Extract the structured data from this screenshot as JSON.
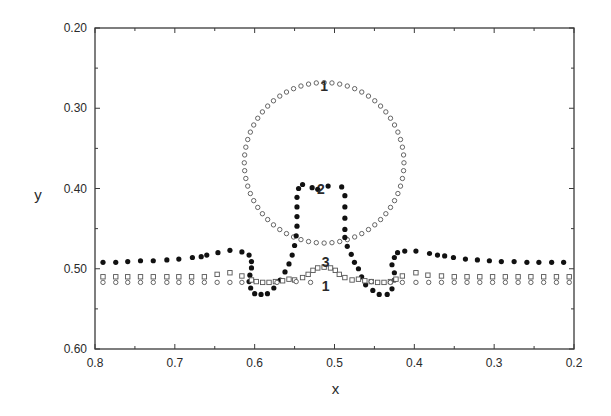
{
  "chart_data": {
    "type": "scatter",
    "title": "",
    "xlabel": "x",
    "ylabel": "y",
    "xlim": [
      0.8,
      0.2
    ],
    "ylim": [
      0.6,
      0.2
    ],
    "x_reversed": true,
    "y_reversed": true,
    "grid": false,
    "xticks": [
      {
        "value": 0.8,
        "label": "0.8"
      },
      {
        "value": 0.7,
        "label": "0.7"
      },
      {
        "value": 0.6,
        "label": "0.6"
      },
      {
        "value": 0.5,
        "label": "0.5"
      },
      {
        "value": 0.4,
        "label": "0.4"
      },
      {
        "value": 0.3,
        "label": "0.3"
      },
      {
        "value": 0.2,
        "label": "0.2"
      }
    ],
    "xminor": [
      0.75,
      0.65,
      0.55,
      0.45,
      0.35,
      0.25
    ],
    "yticks": [
      {
        "value": 0.2,
        "label": "0.20"
      },
      {
        "value": 0.3,
        "label": "0.30"
      },
      {
        "value": 0.4,
        "label": "0.40"
      },
      {
        "value": 0.5,
        "label": "0.50"
      },
      {
        "value": 0.6,
        "label": "0.60"
      }
    ],
    "yminor": [
      0.25,
      0.35,
      0.45,
      0.55
    ],
    "annotations": [
      {
        "text": "1",
        "x": 0.513,
        "y": 0.272
      },
      {
        "text": "2",
        "x": 0.517,
        "y": 0.4
      },
      {
        "text": "3",
        "x": 0.511,
        "y": 0.491
      },
      {
        "text": "1",
        "x": 0.511,
        "y": 0.522
      }
    ],
    "series": [
      {
        "name": "curve-1-circle",
        "marker": "open-circle",
        "description": "Initial circular interface (center 0.513,0.368, radius 0.1) plus flat interface at y=0.517",
        "circle": {
          "cx": 0.513,
          "cy": 0.368,
          "r": 0.1,
          "n_points": 64
        },
        "flat_y": 0.517,
        "flat_x": [
          0.79,
          0.743,
          0.695,
          0.647,
          0.6,
          0.572,
          0.548,
          0.454,
          0.43,
          0.398,
          0.35,
          0.302,
          0.254,
          0.206,
          0.774,
          0.727,
          0.679,
          0.631,
          0.616,
          0.415,
          0.382,
          0.366,
          0.334,
          0.318,
          0.286,
          0.27,
          0.238,
          0.222,
          0.759,
          0.711,
          0.663
        ]
      },
      {
        "name": "curve-2-filled",
        "marker": "filled-circle",
        "points": [
          [
            0.79,
            0.492
          ],
          [
            0.774,
            0.492
          ],
          [
            0.759,
            0.491
          ],
          [
            0.743,
            0.49
          ],
          [
            0.727,
            0.49
          ],
          [
            0.71,
            0.489
          ],
          [
            0.695,
            0.488
          ],
          [
            0.678,
            0.486
          ],
          [
            0.667,
            0.485
          ],
          [
            0.66,
            0.483
          ],
          [
            0.646,
            0.48
          ],
          [
            0.631,
            0.477
          ],
          [
            0.616,
            0.479
          ],
          [
            0.607,
            0.483
          ],
          [
            0.604,
            0.491
          ],
          [
            0.604,
            0.499
          ],
          [
            0.606,
            0.508
          ],
          [
            0.607,
            0.516
          ],
          [
            0.605,
            0.524
          ],
          [
            0.6,
            0.531
          ],
          [
            0.592,
            0.532
          ],
          [
            0.584,
            0.531
          ],
          [
            0.576,
            0.524
          ],
          [
            0.568,
            0.514
          ],
          [
            0.562,
            0.504
          ],
          [
            0.557,
            0.494
          ],
          [
            0.553,
            0.483
          ],
          [
            0.55,
            0.471
          ],
          [
            0.548,
            0.459
          ],
          [
            0.547,
            0.447
          ],
          [
            0.547,
            0.435
          ],
          [
            0.547,
            0.423
          ],
          [
            0.547,
            0.411
          ],
          [
            0.545,
            0.4
          ],
          [
            0.54,
            0.395
          ],
          [
            0.528,
            0.399
          ],
          [
            0.521,
            0.401
          ],
          [
            0.508,
            0.397
          ],
          [
            0.491,
            0.398
          ],
          [
            0.487,
            0.409
          ],
          [
            0.487,
            0.423
          ],
          [
            0.487,
            0.437
          ],
          [
            0.487,
            0.451
          ],
          [
            0.487,
            0.461
          ],
          [
            0.484,
            0.472
          ],
          [
            0.479,
            0.482
          ],
          [
            0.475,
            0.492
          ],
          [
            0.47,
            0.5
          ],
          [
            0.466,
            0.51
          ],
          [
            0.461,
            0.52
          ],
          [
            0.452,
            0.527
          ],
          [
            0.444,
            0.532
          ],
          [
            0.434,
            0.532
          ],
          [
            0.428,
            0.525
          ],
          [
            0.425,
            0.514
          ],
          [
            0.425,
            0.505
          ],
          [
            0.428,
            0.495
          ],
          [
            0.425,
            0.486
          ],
          [
            0.421,
            0.48
          ],
          [
            0.412,
            0.478
          ],
          [
            0.398,
            0.478
          ],
          [
            0.381,
            0.481
          ],
          [
            0.371,
            0.483
          ],
          [
            0.362,
            0.484
          ],
          [
            0.351,
            0.486
          ],
          [
            0.336,
            0.488
          ],
          [
            0.321,
            0.489
          ],
          [
            0.306,
            0.49
          ],
          [
            0.291,
            0.491
          ],
          [
            0.275,
            0.491
          ],
          [
            0.259,
            0.492
          ],
          [
            0.244,
            0.492
          ],
          [
            0.228,
            0.492
          ],
          [
            0.213,
            0.492
          ]
        ]
      },
      {
        "name": "curve-3-square",
        "marker": "open-square",
        "points": [
          [
            0.79,
            0.51
          ],
          [
            0.774,
            0.51
          ],
          [
            0.759,
            0.51
          ],
          [
            0.743,
            0.51
          ],
          [
            0.727,
            0.51
          ],
          [
            0.71,
            0.51
          ],
          [
            0.695,
            0.51
          ],
          [
            0.679,
            0.51
          ],
          [
            0.663,
            0.51
          ],
          [
            0.647,
            0.507
          ],
          [
            0.631,
            0.505
          ],
          [
            0.616,
            0.509
          ],
          [
            0.604,
            0.514
          ],
          [
            0.598,
            0.516
          ],
          [
            0.59,
            0.517
          ],
          [
            0.582,
            0.517
          ],
          [
            0.574,
            0.516
          ],
          [
            0.565,
            0.515
          ],
          [
            0.557,
            0.513
          ],
          [
            0.55,
            0.514
          ],
          [
            0.54,
            0.511
          ],
          [
            0.533,
            0.507
          ],
          [
            0.527,
            0.502
          ],
          [
            0.521,
            0.499
          ],
          [
            0.513,
            0.498
          ],
          [
            0.505,
            0.499
          ],
          [
            0.499,
            0.502
          ],
          [
            0.494,
            0.507
          ],
          [
            0.487,
            0.511
          ],
          [
            0.478,
            0.514
          ],
          [
            0.47,
            0.513
          ],
          [
            0.462,
            0.515
          ],
          [
            0.454,
            0.516
          ],
          [
            0.446,
            0.517
          ],
          [
            0.438,
            0.517
          ],
          [
            0.43,
            0.516
          ],
          [
            0.423,
            0.513
          ],
          [
            0.415,
            0.509
          ],
          [
            0.398,
            0.505
          ],
          [
            0.383,
            0.508
          ],
          [
            0.366,
            0.509
          ],
          [
            0.35,
            0.51
          ],
          [
            0.334,
            0.51
          ],
          [
            0.318,
            0.51
          ],
          [
            0.302,
            0.51
          ],
          [
            0.286,
            0.51
          ],
          [
            0.27,
            0.51
          ],
          [
            0.254,
            0.51
          ],
          [
            0.238,
            0.51
          ],
          [
            0.222,
            0.51
          ],
          [
            0.206,
            0.51
          ]
        ]
      },
      {
        "name": "curve-1-flat-circles",
        "marker": "open-circle",
        "points": [
          [
            0.79,
            0.517
          ],
          [
            0.774,
            0.517
          ],
          [
            0.759,
            0.517
          ],
          [
            0.743,
            0.517
          ],
          [
            0.727,
            0.517
          ],
          [
            0.71,
            0.517
          ],
          [
            0.695,
            0.517
          ],
          [
            0.679,
            0.517
          ],
          [
            0.663,
            0.517
          ],
          [
            0.647,
            0.517
          ],
          [
            0.631,
            0.517
          ],
          [
            0.616,
            0.517
          ],
          [
            0.572,
            0.517
          ],
          [
            0.548,
            0.516
          ],
          [
            0.53,
            0.517
          ],
          [
            0.454,
            0.516
          ],
          [
            0.43,
            0.517
          ],
          [
            0.415,
            0.517
          ],
          [
            0.398,
            0.517
          ],
          [
            0.382,
            0.517
          ],
          [
            0.366,
            0.517
          ],
          [
            0.35,
            0.517
          ],
          [
            0.334,
            0.517
          ],
          [
            0.318,
            0.517
          ],
          [
            0.302,
            0.517
          ],
          [
            0.286,
            0.517
          ],
          [
            0.27,
            0.517
          ],
          [
            0.254,
            0.517
          ],
          [
            0.238,
            0.517
          ],
          [
            0.222,
            0.517
          ],
          [
            0.206,
            0.517
          ]
        ]
      }
    ]
  }
}
